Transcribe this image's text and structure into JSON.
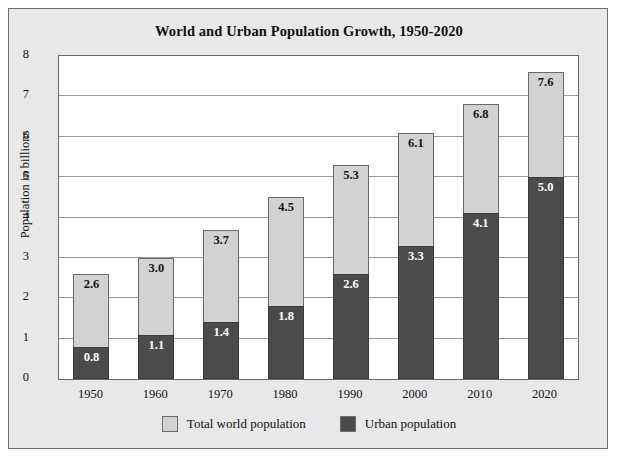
{
  "chart_data": {
    "type": "bar",
    "subtype": "overlapping-stacked-bar",
    "title": "World and Urban Population Growth, 1950-2020",
    "xlabel": "",
    "ylabel": "Population in billions",
    "categories": [
      "1950",
      "1960",
      "1970",
      "1980",
      "1990",
      "2000",
      "2010",
      "2020"
    ],
    "series": [
      {
        "name": "Total world population",
        "color": "#d2d2d2",
        "values": [
          2.6,
          3.0,
          3.7,
          4.5,
          5.3,
          6.1,
          6.8,
          7.6
        ],
        "labels": [
          "2.6",
          "3.0",
          "3.7",
          "4.5",
          "5.3",
          "6.1",
          "6.8",
          "7.6"
        ]
      },
      {
        "name": "Urban population",
        "color": "#4b4b4b",
        "values": [
          0.8,
          1.1,
          1.4,
          1.8,
          2.6,
          3.3,
          4.1,
          5.0
        ],
        "labels": [
          "0.8",
          "1.1",
          "1.4",
          "1.8",
          "2.6",
          "3.3",
          "4.1",
          "5.0"
        ]
      }
    ],
    "ylim": [
      0,
      8
    ],
    "yticks": [
      0,
      1,
      2,
      3,
      4,
      5,
      6,
      7,
      8
    ],
    "ytick_labels": [
      "0",
      "1",
      "2",
      "3",
      "4",
      "5",
      "6",
      "7",
      "8"
    ],
    "grid": true,
    "grid_axis": "y",
    "legend_position": "bottom-center"
  },
  "title": "World and Urban Population Growth, 1950-2020",
  "axes": {
    "y_title": "Population in billions"
  },
  "legend": {
    "entries": [
      {
        "label": "Total world population",
        "color": "#d2d2d2"
      },
      {
        "label": "Urban population",
        "color": "#4b4b4b"
      }
    ]
  },
  "colors": {
    "total_world": "#d2d2d2",
    "urban": "#4b4b4b",
    "background": "#e8e8e8",
    "plot_background": "#ffffff",
    "axis": "#6a6a6a"
  }
}
